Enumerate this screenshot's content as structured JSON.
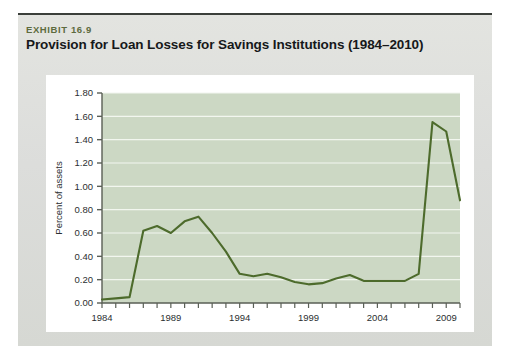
{
  "exhibit": {
    "label": "EXHIBIT 16.9",
    "title": "Provision for Loan Losses for Savings Institutions (1984–2010)"
  },
  "colors": {
    "page_background": "#ffffff",
    "panel_background": "#dfe0dc",
    "panel_rule": "#3b3f3a",
    "card_background": "#ffffff",
    "plot_background": "#ccd8c4",
    "gridline": "#f2f6ef",
    "line": "#4d6b2c",
    "axis": "#5a5f56",
    "exhibit_label_text": "#5d6b3e",
    "title_text": "#16181a",
    "tick_text": "#2b2f31"
  },
  "chart_data": {
    "type": "line",
    "title": "Provision for Loan Losses for Savings Institutions (1984–2010)",
    "xlabel": "Year",
    "ylabel": "Percent of assets",
    "xlim": [
      1984,
      2010
    ],
    "ylim": [
      0.0,
      1.8
    ],
    "ytick_labels": [
      "0.00",
      "0.20",
      "0.40",
      "0.60",
      "0.80",
      "1.00",
      "1.20",
      "1.40",
      "1.60",
      "1.80"
    ],
    "ytick_values": [
      0.0,
      0.2,
      0.4,
      0.6,
      0.8,
      1.0,
      1.2,
      1.4,
      1.6,
      1.8
    ],
    "xtick_labels": [
      "1984",
      "1989",
      "1994",
      "1999",
      "2004",
      "2009"
    ],
    "xtick_values": [
      1984,
      1989,
      1994,
      1999,
      2004,
      2009
    ],
    "xtick_minor_step": 1,
    "grid": "horizontal",
    "legend": "none",
    "x": [
      1984,
      1985,
      1986,
      1987,
      1988,
      1989,
      1990,
      1991,
      1992,
      1993,
      1994,
      1995,
      1996,
      1997,
      1998,
      1999,
      2000,
      2001,
      2002,
      2003,
      2004,
      2005,
      2006,
      2007,
      2008,
      2009,
      2010
    ],
    "series": [
      {
        "name": "Provision for loan losses",
        "values": [
          0.03,
          0.04,
          0.05,
          0.62,
          0.66,
          0.6,
          0.7,
          0.74,
          0.6,
          0.44,
          0.25,
          0.23,
          0.25,
          0.22,
          0.18,
          0.16,
          0.17,
          0.21,
          0.24,
          0.19,
          0.19,
          0.19,
          0.19,
          0.25,
          1.55,
          1.47,
          0.88
        ]
      }
    ]
  }
}
